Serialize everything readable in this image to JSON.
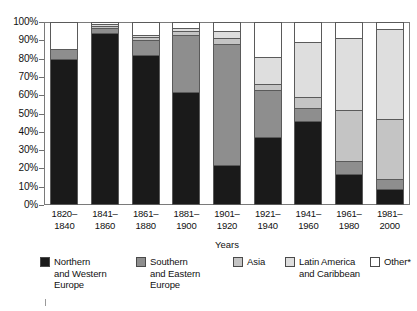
{
  "chart": {
    "axis": {
      "y_ticks": [
        "100%",
        "90%",
        "80%",
        "70%",
        "60%",
        "50%",
        "40%",
        "30%",
        "20%",
        "10%",
        "0%"
      ],
      "x_title": "Years"
    }
  },
  "legend": {
    "items": [
      {
        "label": "Northern\nand Western\nEurope",
        "color": "#1a1a1a",
        "key": "northern-western-europe"
      },
      {
        "label": "Southern\nand Eastern\nEurope",
        "color": "#8e8e8e",
        "key": "southern-eastern-europe"
      },
      {
        "label": "Asia",
        "color": "#c4c4c4",
        "key": "asia"
      },
      {
        "label": "Latin America\nand Caribbean",
        "color": "#dedede",
        "key": "latin-america-caribbean"
      },
      {
        "label": "Other*",
        "color": "#ffffff",
        "key": "other"
      }
    ]
  },
  "chart_data": {
    "type": "bar",
    "title": "",
    "subtitle": "",
    "xlabel": "Years",
    "ylabel": "",
    "ylim": [
      0,
      100
    ],
    "stacked": true,
    "stacked_normalized": true,
    "grid": false,
    "legend_position": "bottom",
    "categories": [
      "1820–\n1840",
      "1841–\n1860",
      "1861–\n1880",
      "1881–\n1900",
      "1901–\n1920",
      "1921–\n1940",
      "1941–\n1960",
      "1961–\n1980",
      "1981–\n2000"
    ],
    "series": [
      {
        "name": "Northern and Western Europe",
        "color": "#1a1a1a",
        "values": [
          80,
          94,
          82,
          62,
          22,
          37,
          46,
          17,
          9
        ]
      },
      {
        "name": "Southern and Eastern Europe",
        "color": "#8e8e8e",
        "values": [
          5,
          3,
          8,
          31,
          66,
          26,
          7,
          7,
          5
        ]
      },
      {
        "name": "Asia",
        "color": "#c4c4c4",
        "values": [
          0,
          1,
          2,
          2,
          3,
          3,
          6,
          28,
          33
        ]
      },
      {
        "name": "Latin America and Caribbean",
        "color": "#dedede",
        "values": [
          0,
          1,
          1,
          2,
          4,
          15,
          30,
          39,
          49
        ]
      },
      {
        "name": "Other*",
        "color": "#ffffff",
        "values": [
          15,
          1,
          7,
          3,
          5,
          19,
          11,
          9,
          4
        ]
      }
    ]
  }
}
